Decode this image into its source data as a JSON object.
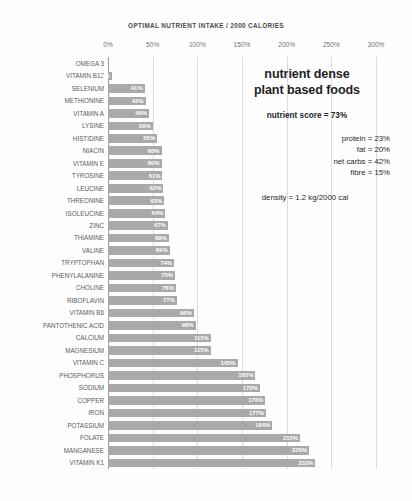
{
  "chart_data": {
    "type": "bar",
    "orientation": "horizontal",
    "title": "OPTIMAL NUTRIENT INTAKE / 2000 CALORIES",
    "xlabel": "",
    "ylabel": "",
    "xlim": [
      0,
      300
    ],
    "grid": true,
    "legend": null,
    "xtick_labels": [
      "0%",
      "50%",
      "100%",
      "150%",
      "200%",
      "250%",
      "300%"
    ],
    "xtick_values": [
      0,
      50,
      100,
      150,
      200,
      250,
      300
    ],
    "bar_color": "#a9a9a9",
    "categories": [
      "OMEGA 3",
      "VITAMIN B12",
      "SELENIUM",
      "METHIONINE",
      "VITAMIN A",
      "LYSINE",
      "HISTIDINE",
      "NIACIN",
      "VITAMIN E",
      "TYROSINE",
      "LEUCINE",
      "THREONINE",
      "ISOLEUCINE",
      "ZINC",
      "THIAMINE",
      "VALINE",
      "TRYPTOPHAN",
      "PHENYLALANINE",
      "CHOLINE",
      "RIBOFLAVIN",
      "VITAMIN B6",
      "PANTOTHENIC ACID",
      "CALCIUM",
      "MAGNESIUM",
      "VITAMIN C",
      "PHOSPHORUS",
      "SODIUM",
      "COPPER",
      "IRON",
      "POTASSIUM",
      "FOLATE",
      "MANGANESE",
      "VITAMIN K1"
    ],
    "values": [
      0,
      4,
      41,
      42,
      46,
      50,
      55,
      60,
      60,
      61,
      62,
      63,
      64,
      67,
      68,
      69,
      74,
      75,
      76,
      77,
      96,
      98,
      115,
      115,
      145,
      165,
      170,
      176,
      177,
      184,
      215,
      225,
      232
    ],
    "data_labels": [
      "",
      "4%",
      "41%",
      "42%",
      "46%",
      "50%",
      "55%",
      "60%",
      "60%",
      "61%",
      "62%",
      "63%",
      "64%",
      "67%",
      "68%",
      "69%",
      "74%",
      "75%",
      "76%",
      "77%",
      "96%",
      "98%",
      "115%",
      "115%",
      "145%",
      "165%",
      "170%",
      "176%",
      "177%",
      "184%",
      "215%",
      "225%",
      "232%"
    ]
  },
  "annotation": {
    "headline_line1": "nutrient dense",
    "headline_line2": "plant based foods",
    "nutrient_score": "nutrient score = 73%",
    "macros": [
      "protein = 23%",
      "fat = 20%",
      "net carbs = 42%",
      "fibre = 15%"
    ],
    "density": "density = 1.2 kg/2000 cal"
  }
}
